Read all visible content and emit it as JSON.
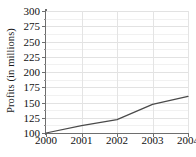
{
  "chart_data": {
    "type": "line",
    "title": "",
    "subtitle": "",
    "xlabel": "",
    "ylabel": "Profits (in millions)",
    "x": [
      2000,
      2001,
      2002,
      2003,
      2004
    ],
    "categories": [
      "2000",
      "2001",
      "2002",
      "2003",
      "2004"
    ],
    "values": [
      100,
      112,
      122,
      147,
      160
    ],
    "series": [
      {
        "name": "Profits",
        "values": [
          100,
          112,
          122,
          147,
          160
        ]
      }
    ],
    "xlim": [
      2000,
      2004
    ],
    "ylim": [
      100,
      300
    ],
    "ytick_labels": [
      "100",
      "125",
      "150",
      "175",
      "200",
      "225",
      "250",
      "275",
      "300"
    ],
    "ytick_values": [
      100,
      125,
      150,
      175,
      200,
      225,
      250,
      275,
      300
    ],
    "yminor_values": [
      112.5,
      137.5,
      162.5,
      187.5,
      212.5,
      237.5,
      262.5,
      287.5
    ],
    "xtick_labels": [
      "2000",
      "2001",
      "2002",
      "2003",
      "2004"
    ],
    "xtick_values": [
      2000,
      2001,
      2002,
      2003,
      2004
    ],
    "grid": true,
    "grid_axes": "both",
    "legend": false,
    "legend_position": "none",
    "line_color": "#4a4a4a",
    "grid_color": "#e2e2e2",
    "minor_grid_color": "#f1f1f1",
    "axis_color": "#6e6e6e",
    "background_color": "#ffffff",
    "text_color": "#111111",
    "markers": false
  }
}
